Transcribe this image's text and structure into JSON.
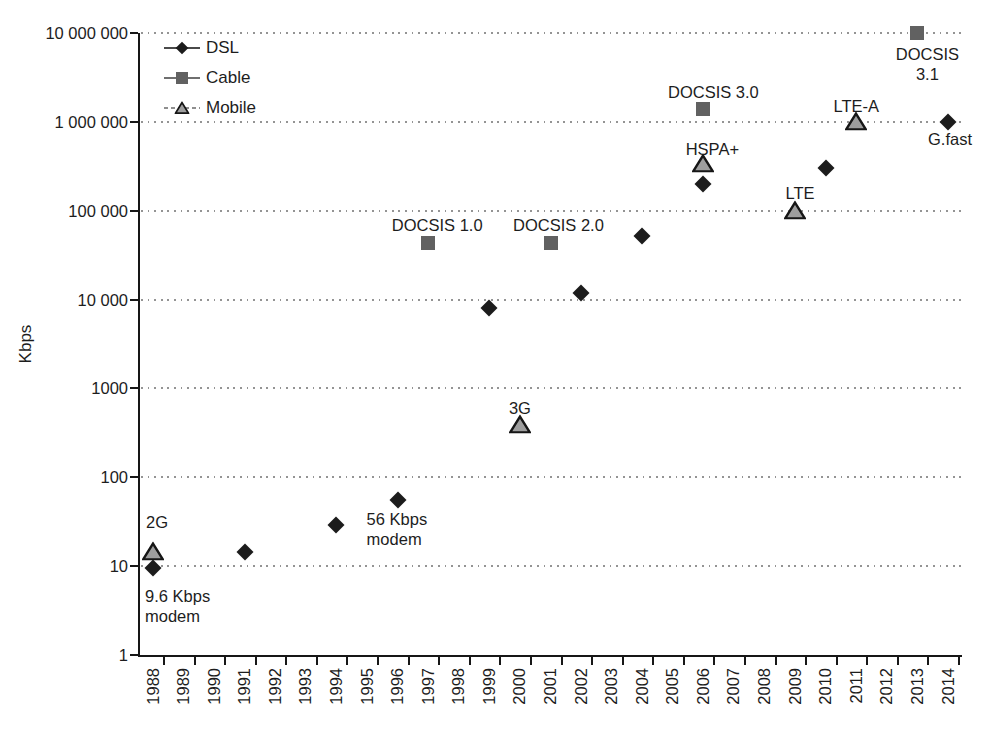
{
  "figure": {
    "background": "#ffffff",
    "text_color": "#1d1d1d",
    "axis_color": "#171717",
    "grid_color": "#949494"
  },
  "chart_data": {
    "type": "scatter",
    "title": "",
    "xlabel": "",
    "ylabel": "Kbps",
    "x_scale": "linear",
    "y_scale": "log",
    "xlim": [
      1988,
      2014
    ],
    "ylim": [
      1,
      10000000
    ],
    "grid": "horizontal dotted",
    "legend_position": "upper left inside",
    "x_ticks": [
      1988,
      1989,
      1990,
      1991,
      1992,
      1993,
      1994,
      1995,
      1996,
      1997,
      1998,
      1999,
      2000,
      2001,
      2002,
      2003,
      2004,
      2005,
      2006,
      2007,
      2008,
      2009,
      2010,
      2011,
      2012,
      2013,
      2014
    ],
    "y_ticks": [
      {
        "value": 1,
        "label": "1"
      },
      {
        "value": 10,
        "label": "10"
      },
      {
        "value": 100,
        "label": "100"
      },
      {
        "value": 1000,
        "label": "1000"
      },
      {
        "value": 10000,
        "label": "10 000"
      },
      {
        "value": 100000,
        "label": "100 000"
      },
      {
        "value": 1000000,
        "label": "1 000 000"
      },
      {
        "value": 10000000,
        "label": "10 000 000"
      }
    ],
    "series": [
      {
        "name": "DSL",
        "marker": "diamond",
        "color": "#1c1c1c",
        "points": [
          {
            "x": 1988,
            "y": 9.6
          },
          {
            "x": 1991,
            "y": 14.4
          },
          {
            "x": 1994,
            "y": 28.8
          },
          {
            "x": 1996,
            "y": 56
          },
          {
            "x": 1999,
            "y": 8000
          },
          {
            "x": 2002,
            "y": 12000
          },
          {
            "x": 2004,
            "y": 52000
          },
          {
            "x": 2006,
            "y": 200000
          },
          {
            "x": 2010,
            "y": 300000
          },
          {
            "x": 2014,
            "y": 1000000
          }
        ]
      },
      {
        "name": "Cable",
        "marker": "square",
        "color": "#616161",
        "points": [
          {
            "x": 1997,
            "y": 43000
          },
          {
            "x": 2001,
            "y": 43000
          },
          {
            "x": 2006,
            "y": 1400000
          },
          {
            "x": 2013,
            "y": 10000000
          }
        ]
      },
      {
        "name": "Mobile",
        "marker": "triangle",
        "color": "#9e9e9e",
        "edge_color": "#161616",
        "points": [
          {
            "x": 1988,
            "y": 14.4
          },
          {
            "x": 2000,
            "y": 384
          },
          {
            "x": 2006,
            "y": 336000
          },
          {
            "x": 2009,
            "y": 100000
          },
          {
            "x": 2011,
            "y": 1000000
          }
        ]
      }
    ],
    "annotations": [
      {
        "text": "2G",
        "year": 1988,
        "value": 14.4,
        "dx": -7,
        "dy": -40,
        "align": "left"
      },
      {
        "text": "9.6 Kbps\nmodem",
        "year": 1988,
        "value": 9.6,
        "dx": -8,
        "dy": 18,
        "align": "left"
      },
      {
        "text": "56 Kbps\nmodem",
        "year": 1996,
        "value": 56,
        "dx": -31,
        "dy": 9,
        "align": "left"
      },
      {
        "text": "DOCSIS 1.0",
        "year": 1997,
        "value": 43000,
        "dx": 9,
        "dy": -28,
        "align": "center"
      },
      {
        "text": "DOCSIS 2.0",
        "year": 2001,
        "value": 43000,
        "dx": 8,
        "dy": -28,
        "align": "center"
      },
      {
        "text": "3G",
        "year": 2000,
        "value": 384,
        "dx": 0,
        "dy": -27,
        "align": "center"
      },
      {
        "text": "DOCSIS 3.0",
        "year": 2006,
        "value": 1400000,
        "dx": 10,
        "dy": -27,
        "align": "center"
      },
      {
        "text": "HSPA+",
        "year": 2006,
        "value": 336000,
        "dx": 9,
        "dy": -25,
        "align": "center"
      },
      {
        "text": "LTE",
        "year": 2009,
        "value": 100000,
        "dx": 5,
        "dy": -28,
        "align": "center"
      },
      {
        "text": "LTE-A",
        "year": 2011,
        "value": 1000000,
        "dx": 0,
        "dy": -26,
        "align": "center"
      },
      {
        "text": "DOCSIS 3.1",
        "year": 2013,
        "value": 10000000,
        "dx": 10,
        "dy": 11,
        "align": "center"
      },
      {
        "text": "G.fast",
        "year": 2014,
        "value": 1000000,
        "dx": 2,
        "dy": 7,
        "align": "center"
      }
    ]
  }
}
